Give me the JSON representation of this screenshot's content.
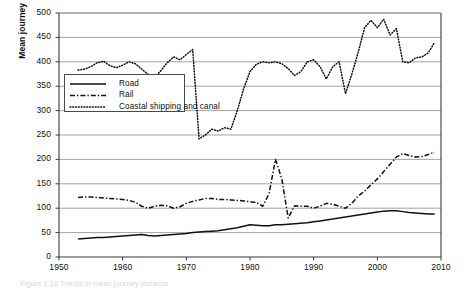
{
  "figure": {
    "caption": "Figure 1.10  Trends in mean journey distance",
    "background": "#ffffff"
  },
  "chart_data": {
    "type": "line",
    "title": "",
    "xlabel": "",
    "ylabel": "Mean journey distance (kilometres)",
    "xlim": [
      1950,
      2010
    ],
    "ylim": [
      0,
      500
    ],
    "xticks": [
      1950,
      1960,
      1970,
      1980,
      1990,
      2000,
      2010
    ],
    "yticks": [
      0,
      50,
      100,
      150,
      200,
      250,
      300,
      350,
      400,
      450,
      500
    ],
    "grid": "horizontal",
    "legend_position": "upper-left-inside",
    "series": [
      {
        "name": "Road",
        "style": "solid",
        "color": "#111111",
        "x": [
          1953,
          1954,
          1955,
          1956,
          1957,
          1958,
          1959,
          1960,
          1961,
          1962,
          1963,
          1964,
          1965,
          1966,
          1967,
          1968,
          1969,
          1970,
          1971,
          1972,
          1973,
          1974,
          1975,
          1976,
          1977,
          1978,
          1979,
          1980,
          1981,
          1982,
          1983,
          1984,
          1985,
          1986,
          1987,
          1988,
          1989,
          1990,
          1991,
          1992,
          1993,
          1994,
          1995,
          1996,
          1997,
          1998,
          1999,
          2000,
          2001,
          2002,
          2003,
          2004,
          2005,
          2006,
          2007,
          2008,
          2009
        ],
        "values": [
          37,
          38,
          39,
          40,
          40,
          41,
          42,
          43,
          44,
          45,
          46,
          44,
          43,
          44,
          45,
          46,
          47,
          48,
          50,
          51,
          52,
          53,
          54,
          56,
          58,
          60,
          63,
          66,
          65,
          64,
          64,
          66,
          66,
          67,
          68,
          69,
          70,
          72,
          74,
          76,
          78,
          80,
          82,
          84,
          86,
          88,
          90,
          92,
          94,
          95,
          95,
          93,
          91,
          90,
          89,
          88,
          88
        ]
      },
      {
        "name": "Rail",
        "style": "dash-dot",
        "color": "#111111",
        "x": [
          1953,
          1954,
          1955,
          1956,
          1957,
          1958,
          1959,
          1960,
          1961,
          1962,
          1963,
          1964,
          1965,
          1966,
          1967,
          1968,
          1969,
          1970,
          1971,
          1972,
          1973,
          1974,
          1975,
          1976,
          1977,
          1978,
          1979,
          1980,
          1981,
          1982,
          1983,
          1984,
          1985,
          1986,
          1987,
          1988,
          1989,
          1990,
          1991,
          1992,
          1993,
          1994,
          1995,
          1996,
          1997,
          1998,
          1999,
          2000,
          2001,
          2002,
          2003,
          2004,
          2005,
          2006,
          2007,
          2008,
          2009
        ],
        "values": [
          122,
          123,
          123,
          122,
          121,
          120,
          119,
          118,
          116,
          112,
          104,
          100,
          104,
          106,
          105,
          100,
          103,
          110,
          114,
          117,
          120,
          120,
          118,
          118,
          117,
          116,
          115,
          113,
          112,
          104,
          130,
          200,
          160,
          80,
          105,
          104,
          104,
          100,
          104,
          110,
          108,
          104,
          100,
          110,
          125,
          135,
          148,
          160,
          175,
          190,
          205,
          212,
          208,
          205,
          206,
          210,
          215
        ]
      },
      {
        "name": "Coastal shipping and canal",
        "style": "dotted",
        "color": "#111111",
        "x": [
          1953,
          1954,
          1955,
          1956,
          1957,
          1958,
          1959,
          1960,
          1961,
          1962,
          1963,
          1964,
          1965,
          1966,
          1967,
          1968,
          1969,
          1970,
          1971,
          1972,
          1973,
          1974,
          1975,
          1976,
          1977,
          1978,
          1979,
          1980,
          1981,
          1982,
          1983,
          1984,
          1985,
          1986,
          1987,
          1988,
          1989,
          1990,
          1991,
          1992,
          1993,
          1994,
          1995,
          1996,
          1997,
          1998,
          1999,
          2000,
          2001,
          2002,
          2003,
          2004,
          2005,
          2006,
          2007,
          2008,
          2009
        ],
        "values": [
          383,
          385,
          390,
          398,
          401,
          392,
          388,
          393,
          400,
          396,
          385,
          374,
          367,
          382,
          398,
          410,
          404,
          415,
          425,
          242,
          250,
          262,
          258,
          265,
          262,
          300,
          345,
          380,
          395,
          400,
          398,
          400,
          396,
          386,
          372,
          380,
          400,
          404,
          390,
          365,
          390,
          400,
          335,
          375,
          420,
          470,
          485,
          470,
          487,
          455,
          468,
          400,
          398,
          408,
          410,
          418,
          440
        ]
      }
    ]
  },
  "legend": {
    "items": [
      {
        "label": "Road",
        "style": "solid"
      },
      {
        "label": "Rail",
        "style": "dash-dot"
      },
      {
        "label": "Coastal shipping and canal",
        "style": "dotted"
      }
    ]
  }
}
